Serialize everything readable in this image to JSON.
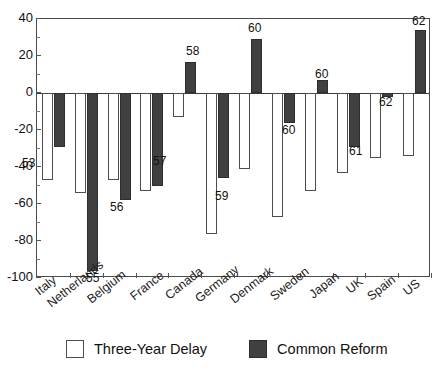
{
  "chart_data": {
    "type": "bar",
    "title": "",
    "subtitle": "",
    "xlabel": "",
    "ylabel": "",
    "ylim": [
      -100,
      40
    ],
    "grid": false,
    "legend_position": "bottom",
    "categories": [
      "Italy",
      "Netherlands",
      "Belgium",
      "France",
      "Canada",
      "Germany",
      "Denmark",
      "Sweden",
      "Japan",
      "UK",
      "Spain",
      "US"
    ],
    "y_ticks": [
      40,
      20,
      0,
      -20,
      -40,
      -60,
      -80,
      -100
    ],
    "y_tick_labels": [
      "40",
      "20",
      "0",
      "-20",
      "-40",
      "-60",
      "-80",
      "-100"
    ],
    "series": [
      {
        "name": "Three-Year Delay",
        "color": "#ffffff",
        "edge_color": "#4d4d4d",
        "values": [
          -47,
          -54,
          -47,
          -53,
          -13,
          -76,
          -41,
          -67,
          -53,
          -43,
          -35,
          -34
        ]
      },
      {
        "name": "Common Reform",
        "color": "#404040",
        "edge_color": "#2e2e2e",
        "values": [
          -29,
          -96,
          -58,
          -50,
          17,
          -46,
          29,
          -16,
          7,
          -29,
          -2,
          34
        ]
      }
    ],
    "figure_numbers": [
      {
        "text": "53",
        "category": "Italy"
      },
      {
        "text": "55",
        "category": "Netherlands"
      },
      {
        "text": "56",
        "category": "Belgium"
      },
      {
        "text": "57",
        "category": "France"
      },
      {
        "text": "58",
        "category": "Canada"
      },
      {
        "text": "59",
        "category": "Germany"
      },
      {
        "text": "60",
        "category": "Denmark"
      },
      {
        "text": "60",
        "category": "Sweden"
      },
      {
        "text": "60",
        "category": "Japan"
      },
      {
        "text": "61",
        "category": "UK"
      },
      {
        "text": "62",
        "category": "Spain"
      },
      {
        "text": "62",
        "category": "US"
      }
    ]
  },
  "legend": {
    "items": [
      {
        "label": "Three-Year Delay",
        "swatch": "white-square-swatch"
      },
      {
        "label": "Common Reform",
        "swatch": "dark-square-swatch"
      }
    ]
  }
}
